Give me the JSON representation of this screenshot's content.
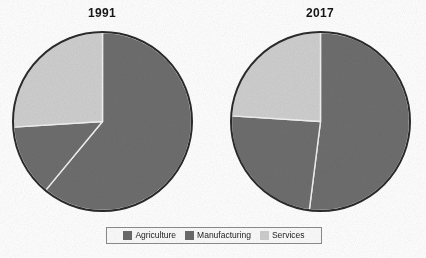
{
  "chart_data": [
    {
      "type": "pie",
      "title": "1991",
      "categories": [
        "Agriculture",
        "Manufacturing",
        "Services"
      ],
      "values": [
        61,
        13,
        26
      ],
      "unit": "percent",
      "start_angle_deg": 0,
      "direction": "clockwise",
      "colors": [
        "#6e6e6e",
        "#6e6e6e",
        "#cfcfcf"
      ],
      "labels_shown": false
    },
    {
      "type": "pie",
      "title": "2017",
      "categories": [
        "Agriculture",
        "Manufacturing",
        "Services"
      ],
      "values": [
        52,
        24,
        24
      ],
      "unit": "percent",
      "start_angle_deg": 0,
      "direction": "clockwise",
      "colors": [
        "#6e6e6e",
        "#6e6e6e",
        "#cfcfcf"
      ],
      "labels_shown": false
    }
  ],
  "titles": {
    "left": "1991",
    "right": "2017"
  },
  "legend": {
    "position": "bottom-center",
    "items": [
      {
        "label": "Agriculture",
        "color": "#6a6a6a"
      },
      {
        "label": "Manufacturing",
        "color": "#6a6a6a"
      },
      {
        "label": "Services",
        "color": "#cecece"
      }
    ]
  },
  "style": {
    "slice_separator_color": "#f2f2f2",
    "pie_outline_color": "#2b2b2b",
    "background": "#ffffff",
    "text_color": "#161616"
  }
}
